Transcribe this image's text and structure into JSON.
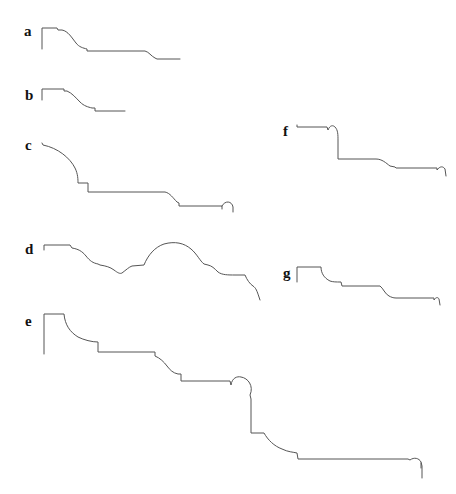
{
  "figure": {
    "panels": [
      {
        "label": "a",
        "x": 24,
        "y": 25
      },
      {
        "label": "b",
        "x": 25,
        "y": 88
      },
      {
        "label": "c",
        "x": 25,
        "y": 139
      },
      {
        "label": "d",
        "x": 25,
        "y": 242
      },
      {
        "label": "e",
        "x": 25,
        "y": 315
      },
      {
        "label": "f",
        "x": 282,
        "y": 125
      },
      {
        "label": "g",
        "x": 282,
        "y": 267
      }
    ],
    "stroke_color": "#555555",
    "label_color": "#111111",
    "background": "#ffffff"
  }
}
